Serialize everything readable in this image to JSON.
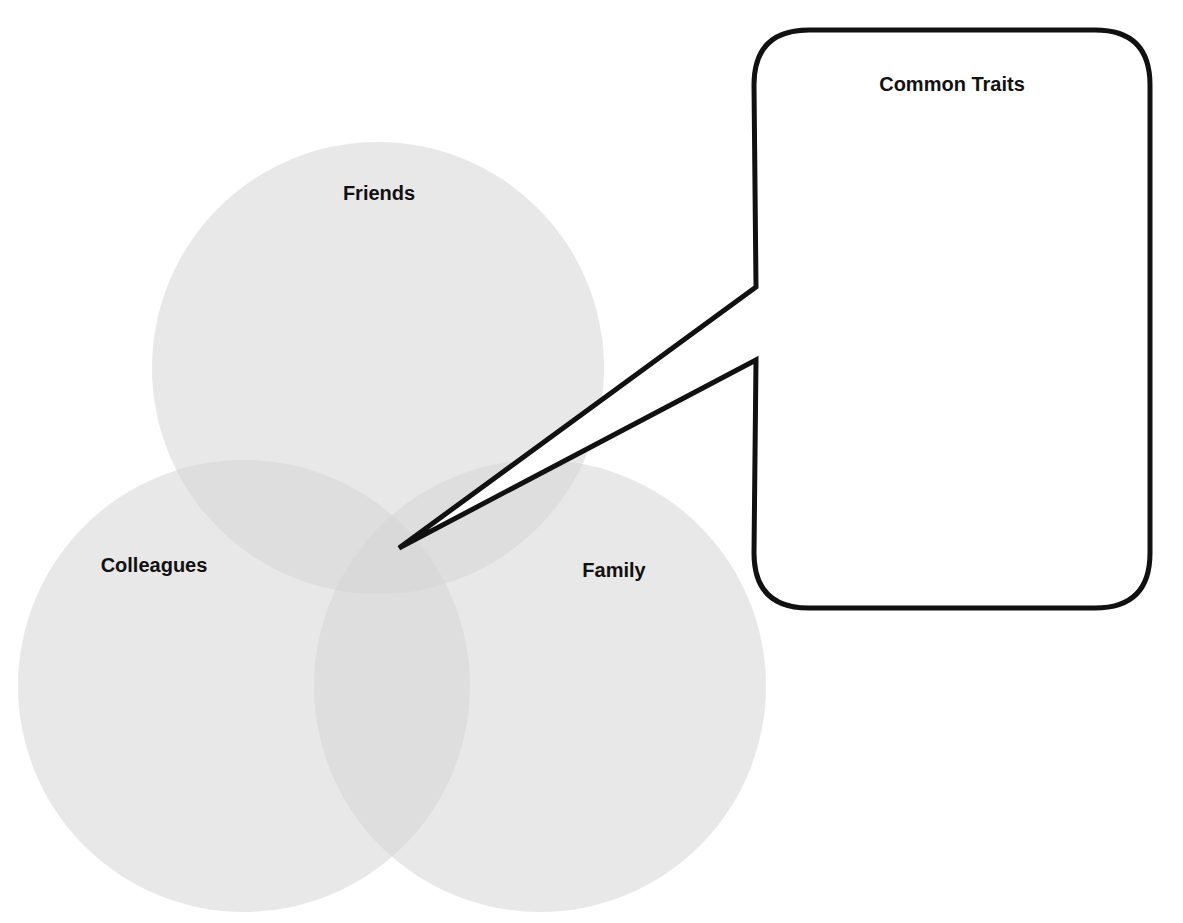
{
  "diagram": {
    "type": "venn",
    "circles": [
      {
        "id": "friends",
        "label": "Friends",
        "cx": 378,
        "cy": 368,
        "r": 226,
        "label_x": 379,
        "label_y": 200
      },
      {
        "id": "colleagues",
        "label": "Colleagues",
        "cx": 244,
        "cy": 686,
        "r": 226,
        "label_x": 154,
        "label_y": 572
      },
      {
        "id": "family",
        "label": "Family",
        "cx": 540,
        "cy": 686,
        "r": 226,
        "label_x": 614,
        "label_y": 577
      }
    ],
    "fill_color": "#d6d6d6",
    "fill_opacity": 0.55,
    "callout": {
      "title": "Common Traits",
      "box": {
        "x": 754,
        "y": 30,
        "width": 396,
        "height": 578,
        "radius": 55
      },
      "tail_tip": {
        "x": 399,
        "y": 548
      },
      "tail_base_top": {
        "x": 756,
        "y": 287
      },
      "tail_base_bottom": {
        "x": 756,
        "y": 360
      },
      "stroke_color": "#111111",
      "stroke_width": 5
    }
  }
}
